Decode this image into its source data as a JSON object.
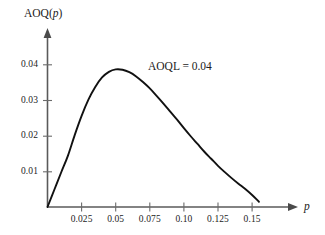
{
  "chart_data": {
    "type": "line",
    "title": "",
    "xlabel": "p",
    "ylabel": "AOQ(p)",
    "xlim": [
      0,
      0.1838
    ],
    "ylim": [
      0,
      0.0494
    ],
    "grid": false,
    "legend_position": "none",
    "annotations": [
      {
        "text": "AOQL = 0.04",
        "x": 0.0745,
        "y": 0.0407
      }
    ],
    "x_ticks": [
      0.025,
      0.05,
      0.075,
      0.1,
      0.125,
      0.15
    ],
    "x_tick_labels": [
      "0.025",
      "0.05",
      "0.075",
      "0.10",
      "0.125",
      "0.15"
    ],
    "y_ticks": [
      0.01,
      0.02,
      0.03,
      0.04
    ],
    "y_tick_labels": [
      "0.01",
      "0.02",
      "0.03",
      "0.04"
    ],
    "series": [
      {
        "name": "AOQ(p)",
        "color": "#111111",
        "x": [
          0.0,
          0.005,
          0.01,
          0.015,
          0.02,
          0.025,
          0.03,
          0.035,
          0.04,
          0.045,
          0.05,
          0.055,
          0.06,
          0.065,
          0.07,
          0.075,
          0.08,
          0.085,
          0.09,
          0.095,
          0.1,
          0.105,
          0.11,
          0.115,
          0.12,
          0.125,
          0.13,
          0.135,
          0.14,
          0.145,
          0.15,
          0.155
        ],
        "y": [
          0.0,
          0.0049,
          0.0098,
          0.0146,
          0.0205,
          0.0259,
          0.0305,
          0.0341,
          0.0368,
          0.0384,
          0.0391,
          0.039,
          0.0383,
          0.0371,
          0.0355,
          0.0337,
          0.0316,
          0.0294,
          0.0271,
          0.0248,
          0.0224,
          0.0201,
          0.0179,
          0.0157,
          0.0137,
          0.0117,
          0.0099,
          0.0082,
          0.0066,
          0.0051,
          0.0034,
          0.0015
        ]
      }
    ]
  },
  "labels": {
    "y_axis_prefix": "AOQ(",
    "y_axis_var": "p",
    "y_axis_suffix": ")",
    "x_axis_var": "p",
    "aoql_text": "AOQL = 0.04"
  }
}
